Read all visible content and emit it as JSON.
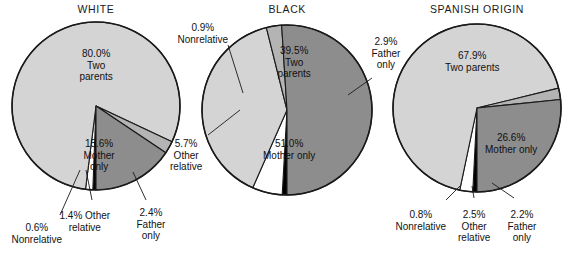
{
  "figure": {
    "background_color": "#ffffff",
    "width": 572,
    "height": 256
  },
  "palette": {
    "two_parents": "#d4d4d4",
    "mother_only": "#8d8d8d",
    "father_only": "#b4b4b4",
    "other_relative": "#ffffff",
    "nonrelative": "#000000",
    "outline": "#1a1a1a",
    "text": "#121212"
  },
  "charts": [
    {
      "id": "white",
      "title": "WHITE",
      "title_x": 96,
      "title_y": 3,
      "center_x": 96,
      "center_y": 106,
      "radius": 84,
      "slices": [
        {
          "name": "two-parents",
          "label": "80.0%\nTwo\nparents",
          "value": 80.0,
          "color": "#d4d4d4",
          "label_x": 96,
          "label_y": 48,
          "inside": true
        },
        {
          "name": "mother-only",
          "label": "15.6%\nMother\nonly",
          "value": 15.6,
          "color": "#8d8d8d",
          "label_x": 99,
          "label_y": 138,
          "inside": true
        },
        {
          "name": "father-only",
          "label": "2.4%\nFather\nonly",
          "value": 2.4,
          "color": "#b4b4b4",
          "label_x": 151,
          "label_y": 207,
          "inside": false
        },
        {
          "name": "other-relative",
          "label": "1.4% Other\nrelative",
          "value": 1.4,
          "color": "#ffffff",
          "label_x": 85,
          "label_y": 210,
          "inside": false
        },
        {
          "name": "nonrelative",
          "label": "0.6%\nNonrelative",
          "value": 0.6,
          "color": "#000000",
          "label_x": 37,
          "label_y": 222,
          "inside": false
        }
      ]
    },
    {
      "id": "black",
      "title": "BLACK",
      "title_x": 287,
      "title_y": 3,
      "center_x": 287,
      "center_y": 110,
      "radius": 85,
      "slices": [
        {
          "name": "two-parents",
          "label": "39.5%\nTwo\nparents",
          "value": 39.5,
          "color": "#d4d4d4",
          "label_x": 294,
          "label_y": 45,
          "inside": true
        },
        {
          "name": "mother-only",
          "label": "51.0%\nMother only",
          "value": 51.0,
          "color": "#8d8d8d",
          "label_x": 289,
          "label_y": 138,
          "inside": true
        },
        {
          "name": "father-only",
          "label": "2.9%\nFather\nonly",
          "value": 2.9,
          "color": "#b4b4b4",
          "label_x": 386,
          "label_y": 36,
          "inside": false
        },
        {
          "name": "other-relative",
          "label": "5.7%\nOther\nrelative",
          "value": 5.7,
          "color": "#ffffff",
          "label_x": 186,
          "label_y": 138,
          "inside": false
        },
        {
          "name": "nonrelative",
          "label": "0.9%\nNonrelative",
          "value": 0.9,
          "color": "#000000",
          "label_x": 203,
          "label_y": 22,
          "inside": false
        }
      ]
    },
    {
      "id": "spanish-origin",
      "title": "SPANISH ORIGIN",
      "title_x": 477,
      "title_y": 3,
      "center_x": 477,
      "center_y": 108,
      "radius": 84,
      "slices": [
        {
          "name": "two-parents",
          "label": "67.9%\nTwo parents",
          "value": 67.9,
          "color": "#d4d4d4",
          "label_x": 472,
          "label_y": 50,
          "inside": true
        },
        {
          "name": "mother-only",
          "label": "26.6%\nMother only",
          "value": 26.6,
          "color": "#8d8d8d",
          "label_x": 511,
          "label_y": 132,
          "inside": true
        },
        {
          "name": "father-only",
          "label": "2.2%\nFather\nonly",
          "value": 2.2,
          "color": "#b4b4b4",
          "label_x": 522,
          "label_y": 209,
          "inside": false
        },
        {
          "name": "other-relative",
          "label": "2.5%\nOther\nrelative",
          "value": 2.5,
          "color": "#ffffff",
          "label_x": 474,
          "label_y": 209,
          "inside": false
        },
        {
          "name": "nonrelative",
          "label": "0.8%\nNonrelative",
          "value": 0.8,
          "color": "#000000",
          "label_x": 421,
          "label_y": 209,
          "inside": false
        }
      ]
    }
  ],
  "leader_lines": [
    {
      "name": "white-nonrelative-leader",
      "points": "60,215 80,170"
    },
    {
      "name": "white-other-relative-leader",
      "points": "92,200 86,170"
    },
    {
      "name": "white-father-only-leader",
      "points": "146,200 133,172"
    },
    {
      "name": "black-nonrelative-leader",
      "points": "228,45 243,93"
    },
    {
      "name": "black-other-relative-leader",
      "points": "208,135 240,110"
    },
    {
      "name": "black-father-only-leader",
      "points": "372,78 348,95"
    },
    {
      "name": "spanish-nonrelative-leader",
      "points": "446,200 460,186"
    },
    {
      "name": "spanish-other-relative-leader",
      "points": "474,198 472,186"
    },
    {
      "name": "spanish-father-only-leader",
      "points": "514,198 492,183"
    }
  ],
  "chart_data": {
    "type": "pie",
    "categories": [
      "Two parents",
      "Mother only",
      "Father only",
      "Other relative",
      "Nonrelative"
    ],
    "series": [
      {
        "name": "WHITE",
        "values": [
          80.0,
          15.6,
          2.4,
          1.4,
          0.6
        ]
      },
      {
        "name": "BLACK",
        "values": [
          39.5,
          51.0,
          2.9,
          5.7,
          0.9
        ]
      },
      {
        "name": "SPANISH ORIGIN",
        "values": [
          67.9,
          26.6,
          2.2,
          2.5,
          0.8
        ]
      }
    ],
    "units": "percent",
    "legend": "none",
    "grid": false,
    "data_labels": true,
    "slice_colors": {
      "Two parents": "#d4d4d4",
      "Mother only": "#8d8d8d",
      "Father only": "#b4b4b4",
      "Other relative": "#ffffff",
      "Nonrelative": "#000000"
    }
  }
}
